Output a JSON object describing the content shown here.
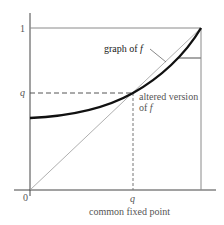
{
  "diagram": {
    "y_axis_labels": {
      "one": "1",
      "q": "q"
    },
    "x_axis_labels": {
      "zero": "0",
      "q": "q"
    },
    "curve_label": {
      "prefix": "graph of ",
      "var": "f"
    },
    "altered_label": {
      "line1": "altered version",
      "line2_prefix": "of ",
      "line2_var": "f"
    },
    "caption": "common fixed point",
    "colors": {
      "curve": "#111111",
      "axes": "#444444",
      "diagonal": "#9a9a9a",
      "frame": "#8a8a8a",
      "dashed": "#555555",
      "text": "#555555"
    }
  }
}
